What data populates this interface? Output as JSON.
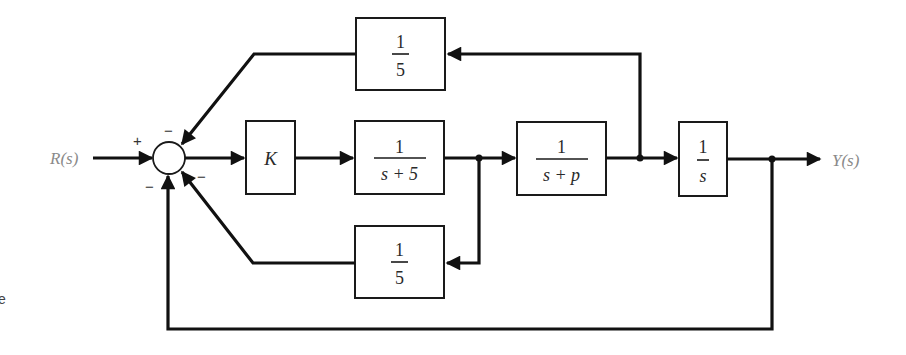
{
  "diagram": {
    "type": "block-diagram",
    "input_signal": "R(s)",
    "output_signal": "Y(s)",
    "summing_junction": {
      "signs": {
        "input": "+",
        "top_feedback": "−",
        "lower_feedback": "−",
        "unity_feedback": "−"
      }
    },
    "blocks": {
      "gain": {
        "label": "K"
      },
      "plant1": {
        "numerator": "1",
        "denominator": "s + 5"
      },
      "plant2": {
        "numerator": "1",
        "denominator_s": "s + ",
        "denominator_p": "p"
      },
      "integrator": {
        "numerator": "1",
        "denominator": "s"
      },
      "top_feedback": {
        "numerator": "1",
        "denominator": "5"
      },
      "inner_feedback": {
        "numerator": "1",
        "denominator": "5"
      }
    },
    "edge_fragment": "e"
  }
}
